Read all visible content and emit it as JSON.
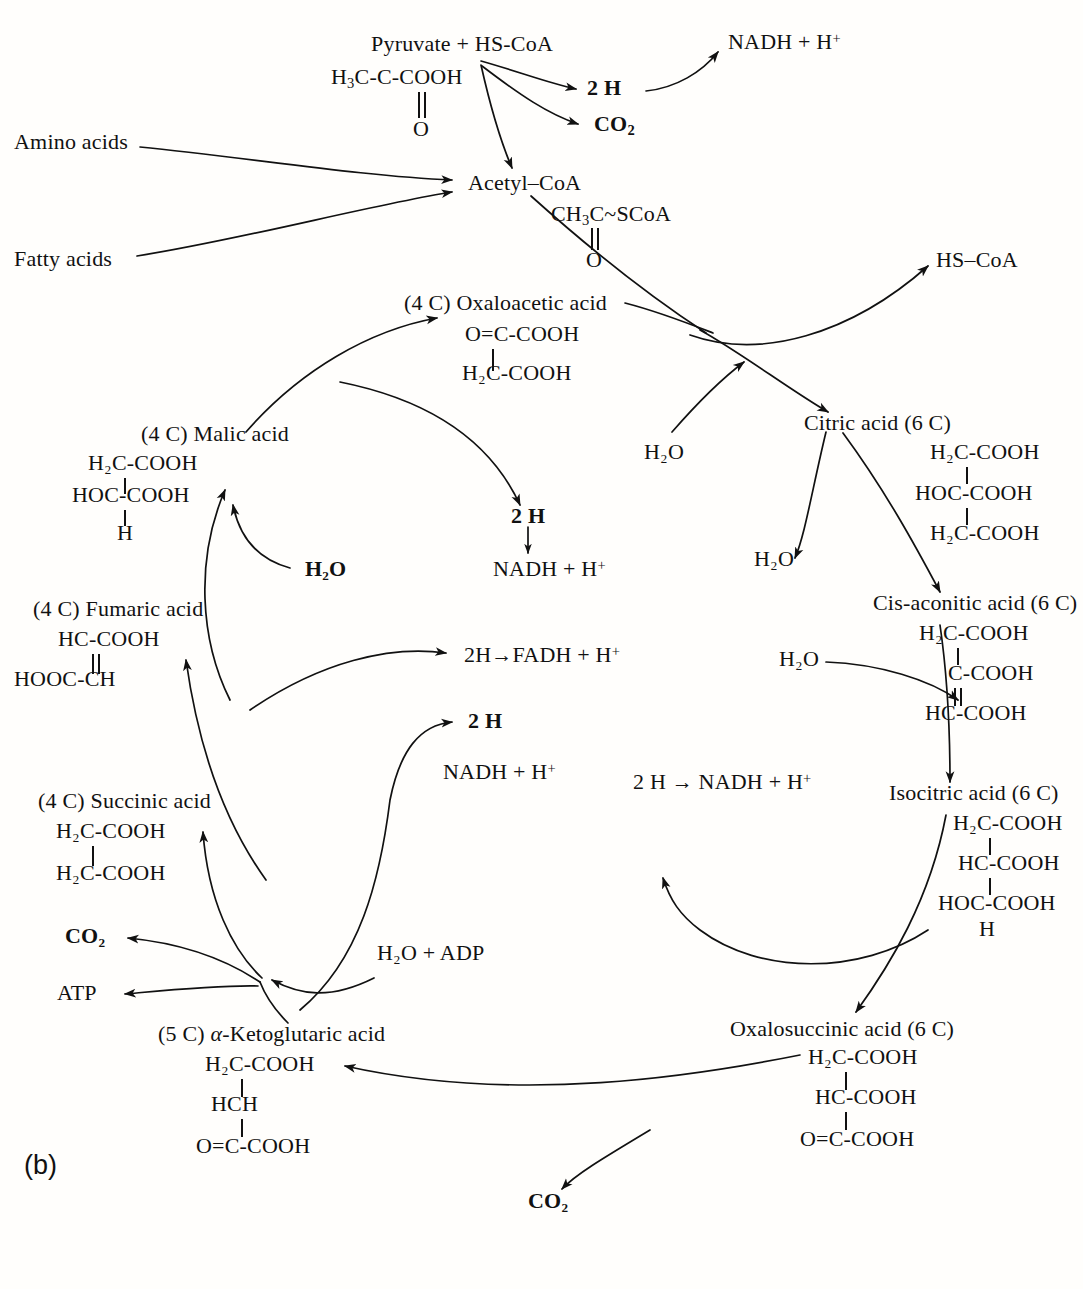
{
  "figure": {
    "panel_label": "(b)"
  },
  "inputs": {
    "pyruvate_label": "Pyruvate + HS-CoA",
    "pyruvate_formula_line1_a": "H",
    "pyruvate_formula_line1_b": "3",
    "pyruvate_formula_line1_c": "C-C-COOH",
    "pyruvate_formula_o": "O",
    "amino_acids": "Amino acids",
    "fatty_acids": "Fatty acids"
  },
  "products_top": {
    "two_h": "2 H",
    "co2": "CO",
    "co2_sub": "2",
    "nadh": "NADH + H",
    "nadh_sup": "+"
  },
  "acetyl": {
    "name": "Acetyl–CoA",
    "formula_a": "CH",
    "formula_sub": "3",
    "formula_b": "C~SCoA",
    "formula_o": "O",
    "hs_coa": "HS–CoA"
  },
  "cycle": [
    {
      "id": "oxaloacetic",
      "name": "(4 C) Oxaloacetic acid",
      "lines": [
        "O=C-COOH",
        "H₂C-COOH"
      ]
    },
    {
      "id": "citric",
      "name": "Citric acid (6 C)",
      "lines": [
        "H₂C-COOH",
        "HOC-COOH",
        "H₂C-COOH"
      ]
    },
    {
      "id": "cis-aconitic",
      "name": "Cis-aconitic acid (6 C)",
      "lines": [
        "H₂C-COOH",
        "C-COOH",
        "HC-COOH"
      ]
    },
    {
      "id": "isocitric",
      "name": "Isocitric acid (6 C)",
      "lines": [
        "H₂C-COOH",
        "HC-COOH",
        "HOC-COOH",
        "H"
      ]
    },
    {
      "id": "oxalosuccinic",
      "name": "Oxalosuccinic acid (6 C)",
      "lines": [
        "H₂C-COOH",
        "HC-COOH",
        "O=C-COOH"
      ]
    },
    {
      "id": "alpha-ketoglutaric",
      "name_pre": "(5 C) ",
      "name_alpha": "α",
      "name_post": "-Ketoglutaric acid",
      "name": "(5 C) α-Ketoglutaric acid",
      "lines": [
        "H₂C-COOH",
        "HCH",
        "O=C-COOH"
      ]
    },
    {
      "id": "succinic",
      "name": "(4 C) Succinic acid",
      "lines": [
        "H₂C-COOH",
        "H₂C-COOH"
      ]
    },
    {
      "id": "fumaric",
      "name": "(4 C) Fumaric acid",
      "lines": [
        "HC-COOH",
        "HOOC-CH"
      ]
    },
    {
      "id": "malic",
      "name": "(4 C) Malic acid",
      "lines": [
        "H₂C-COOH",
        "HOC-COOH",
        "H"
      ]
    }
  ],
  "cofactors": {
    "h2o": "H₂O",
    "h2o_adp": "H₂O + ADP",
    "co2": "CO₂",
    "atp": "ATP",
    "two_h_bold": "2 H",
    "two_h_tight": "2H",
    "nadh_plus_h": "NADH + H",
    "fadh_plus_h": "FADH + H",
    "plus_sup": "+",
    "arrow": "→",
    "down_arrow": "↓"
  },
  "colors": {
    "ink": "#111111",
    "paper": "#fffefc"
  }
}
